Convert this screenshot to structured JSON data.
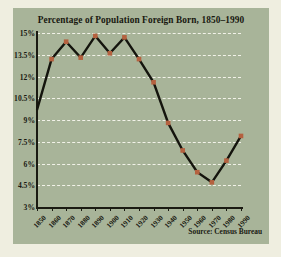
{
  "figure": {
    "title": "Percentage of Population Foreign Born, 1850–1990",
    "source": "Source: Census Bureau",
    "panel_color": "#a8b499",
    "background_color": "#efeee0",
    "line_color": "#14140d",
    "marker_color": "#b5613f",
    "grid_color": "#f2f2e8"
  },
  "chart_data": {
    "type": "line",
    "title": "Percentage of Population Foreign Born, 1850–1990",
    "xlabel": "",
    "ylabel": "",
    "x": [
      1850,
      1860,
      1870,
      1880,
      1890,
      1900,
      1910,
      1920,
      1930,
      1940,
      1950,
      1960,
      1970,
      1980,
      1990
    ],
    "categories": [
      "1850",
      "1860",
      "1870",
      "1880",
      "1890",
      "1900",
      "1910",
      "1920",
      "1930",
      "1940",
      "1950",
      "1960",
      "1970",
      "1980",
      "1990"
    ],
    "values": [
      9.7,
      13.2,
      14.4,
      13.3,
      14.8,
      13.6,
      14.7,
      13.2,
      11.6,
      8.8,
      6.9,
      5.4,
      4.7,
      6.2,
      7.9
    ],
    "series": [
      {
        "name": "Percentage foreign born",
        "values": [
          9.7,
          13.2,
          14.4,
          13.3,
          14.8,
          13.6,
          14.7,
          13.2,
          11.6,
          8.8,
          6.9,
          5.4,
          4.7,
          6.2,
          7.9
        ]
      }
    ],
    "ylim": [
      3,
      15
    ],
    "xlim": [
      1850,
      1990
    ],
    "yticks": [
      3,
      4.5,
      6,
      7.5,
      9,
      10.5,
      12,
      13.5,
      15
    ],
    "ytick_labels": [
      "3%",
      "4.5%",
      "6%",
      "7.5%",
      "9%",
      "10.5%",
      "12%",
      "13.5%",
      "15%"
    ],
    "xticks": [
      1850,
      1860,
      1870,
      1880,
      1890,
      1900,
      1910,
      1920,
      1930,
      1940,
      1950,
      1960,
      1970,
      1980,
      1990
    ],
    "xtick_labels": [
      "1850",
      "1860",
      "1870",
      "1880",
      "1890",
      "1900",
      "1910",
      "1920",
      "1930",
      "1940",
      "1950",
      "1960",
      "1970",
      "1980",
      "1990"
    ],
    "grid": true,
    "grid_style": "dashed-horizontal",
    "legend": false,
    "marker": "square",
    "annotations": [
      "Source: Census Bureau"
    ]
  }
}
